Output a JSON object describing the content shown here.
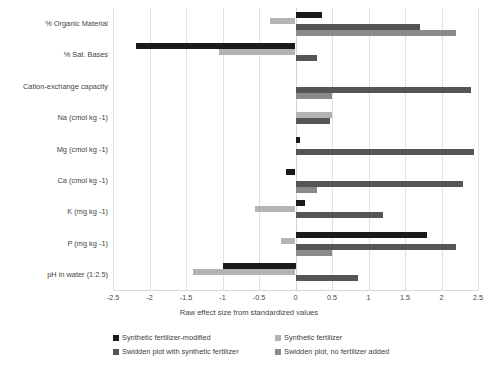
{
  "chart_data": {
    "type": "bar",
    "orientation": "horizontal",
    "title": "",
    "xlabel": "Raw effect size from standardized values",
    "ylabel": "",
    "xlim": [
      -2.5,
      2.5
    ],
    "xticks": [
      "-2.5",
      "-2",
      "-1.5",
      "-1",
      "-0.5",
      "0",
      "0.5",
      "1",
      "1.5",
      "2",
      "2.5"
    ],
    "grid": true,
    "legend_position": "bottom",
    "categories": [
      "% Organic Material",
      "% Sat. Bases",
      "Cation-exchange capacity",
      "Na (cmol kg -1)",
      "Mg (cmol kg -1)",
      "Ca (cmol kg -1)",
      "K (mg kg -1)",
      "P (mg kg -1)",
      "pH in water (1:2.5)"
    ],
    "series": [
      {
        "name": "Synthetic fertilizer-modified",
        "color": "#1a1a1a",
        "values": [
          0.36,
          -2.18,
          0.0,
          0.0,
          0.06,
          -0.13,
          0.13,
          1.8,
          -1.0
        ]
      },
      {
        "name": "Synthetic fertilizer",
        "color": "#b3b3b3",
        "values": [
          -0.35,
          -1.05,
          0.0,
          0.5,
          0.0,
          0.0,
          -0.55,
          -0.2,
          -1.4
        ]
      },
      {
        "name": "Swidden plot with synthetic fertilizer",
        "color": "#555555",
        "values": [
          1.7,
          0.3,
          2.4,
          0.47,
          2.45,
          2.3,
          1.2,
          2.2,
          0.85
        ]
      },
      {
        "name": "Swidden plot, no fertilizer added",
        "color": "#8a8a8a",
        "values": [
          2.2,
          0.0,
          0.5,
          0.0,
          0.0,
          0.3,
          0.0,
          0.5,
          0.0
        ]
      }
    ]
  },
  "legend": {
    "items": [
      "Synthetic fertilizer-modified",
      "Synthetic fertilizer",
      "Swidden plot with synthetic fertilizer",
      "Swidden plot, no fertilizer added"
    ]
  }
}
